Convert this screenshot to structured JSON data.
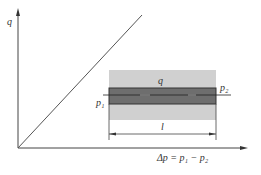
{
  "diagram": {
    "y_axis_label": "q",
    "x_axis_label": "Δp = p₁ − p₂",
    "pipe": {
      "flow_label": "q",
      "inlet_pressure_label": "p₁",
      "outlet_pressure_label": "p₂",
      "length_label": "l"
    },
    "relation": "linear",
    "colors": {
      "axis": "#444444",
      "line": "#555555",
      "outer_region": "#d0d0d0",
      "pipe": "#6e6e6e",
      "pipe_border": "#333333"
    }
  }
}
